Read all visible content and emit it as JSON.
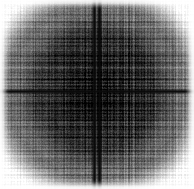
{
  "figure": {
    "title": "",
    "subtitle": "",
    "caption": "Grayscale two-dimensional interference / Fourier magnitude pattern",
    "width": 194,
    "height": 189,
    "background_color": "#ffffff",
    "has_axes": false,
    "has_legend": false,
    "has_tick_labels": false,
    "has_colorbar": false,
    "has_text": false,
    "colormap": "grayscale-inverted"
  },
  "chart_data": {
    "type": "heatmap",
    "title": "",
    "subtitle": "",
    "xlabel": "",
    "ylabel": "",
    "xticklabels": [],
    "yticklabels": [],
    "legend_entries": [],
    "legend_position": "none",
    "grid": false,
    "colormap": "gray_r",
    "value_range": [
      0,
      255
    ],
    "dark_is_high": true,
    "field_model": {
      "model": "separable-sinc-product-with-radial-envelope",
      "center_x": 96,
      "center_y": 91,
      "cross_vertical_positions": [
        94,
        99
      ],
      "cross_horizontal_positions": [
        91
      ],
      "cross_darkness": 14,
      "cross_vertical_width": 2.0,
      "cross_horizontal_width": 1.8,
      "core_radius": 52,
      "core_level": 22,
      "mid_radius": 86,
      "mid_level": 120,
      "outer_radius": 120,
      "outer_level": 250,
      "stripe_period_x": 3.1,
      "stripe_period_y": 3.4,
      "stripe_secondary_period_x": 7.3,
      "stripe_secondary_period_y": 8.1,
      "stripe_amplitude": 58,
      "noise_amplitude": 34,
      "margin_fade_px": 9,
      "gamma": 1.15,
      "seed": 20240517
    },
    "sampled_intensity_profile": {
      "note": "Mean pixel luminance (0=black,255=white) sampled along the horizontal line through the centre.",
      "x": [
        0,
        10,
        20,
        30,
        40,
        50,
        60,
        70,
        80,
        90,
        96,
        102,
        112,
        122,
        132,
        142,
        152,
        162,
        172,
        182,
        193
      ],
      "luminance": [
        250,
        226,
        176,
        132,
        96,
        70,
        52,
        38,
        28,
        18,
        12,
        18,
        30,
        42,
        58,
        80,
        108,
        150,
        200,
        238,
        252
      ]
    },
    "sampled_vertical_profile": {
      "note": "Mean pixel luminance sampled along the vertical line through the centre.",
      "y": [
        0,
        10,
        20,
        30,
        40,
        50,
        60,
        70,
        80,
        91,
        100,
        110,
        120,
        130,
        140,
        150,
        160,
        170,
        180,
        188
      ],
      "luminance": [
        248,
        218,
        168,
        126,
        92,
        66,
        48,
        34,
        24,
        12,
        22,
        34,
        48,
        66,
        92,
        128,
        176,
        220,
        246,
        252
      ]
    }
  }
}
